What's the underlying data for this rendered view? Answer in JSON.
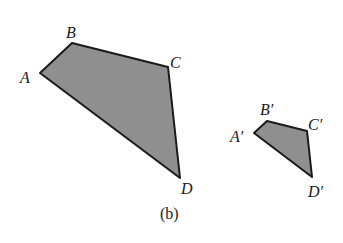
{
  "figure": {
    "caption": "(b)",
    "fill_color": "#8f8f8f",
    "stroke_color": "#1a1a1a",
    "large_quadrilateral": {
      "labels": {
        "A": "A",
        "B": "B",
        "C": "C",
        "D": "D"
      },
      "points": "40,73 72,43 168,67 180,178"
    },
    "small_quadrilateral": {
      "labels": {
        "A": "A′",
        "B": "B′",
        "C": "C′",
        "D": "D′"
      },
      "points": "254,133 267,121 307,131 312,177"
    }
  }
}
